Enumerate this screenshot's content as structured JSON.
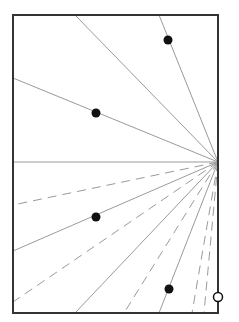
{
  "diagram": {
    "width": 239,
    "height": 322,
    "frame": {
      "x": 13,
      "y": 15,
      "width": 205,
      "height": 298,
      "stroke": "#333333",
      "stroke_width": 2
    },
    "focal_point": {
      "x": 218,
      "y": 162
    },
    "ray_color": "#9a9a9a",
    "rays": [
      {
        "to": [
          75,
          15
        ],
        "style": "solid"
      },
      {
        "to": [
          159,
          15
        ],
        "style": "solid"
      },
      {
        "to": [
          13,
          78
        ],
        "style": "solid"
      },
      {
        "to": [
          13,
          162
        ],
        "style": "solid"
      },
      {
        "to": [
          13,
          205
        ],
        "style": "dashed"
      },
      {
        "to": [
          13,
          251
        ],
        "style": "solid"
      },
      {
        "to": [
          13,
          302
        ],
        "style": "dashed"
      },
      {
        "to": [
          75,
          313
        ],
        "style": "solid"
      },
      {
        "to": [
          124,
          313
        ],
        "style": "dashed"
      },
      {
        "to": [
          159,
          313
        ],
        "style": "solid"
      },
      {
        "to": [
          192,
          313
        ],
        "style": "dashed"
      },
      {
        "to": [
          204,
          313
        ],
        "style": "dashed"
      }
    ],
    "filled_points": [
      {
        "x": 168,
        "y": 40
      },
      {
        "x": 96,
        "y": 113
      },
      {
        "x": 96,
        "y": 217
      },
      {
        "x": 169,
        "y": 289
      }
    ],
    "open_points": [
      {
        "x": 218,
        "y": 297
      }
    ],
    "point_color": "#111111"
  }
}
